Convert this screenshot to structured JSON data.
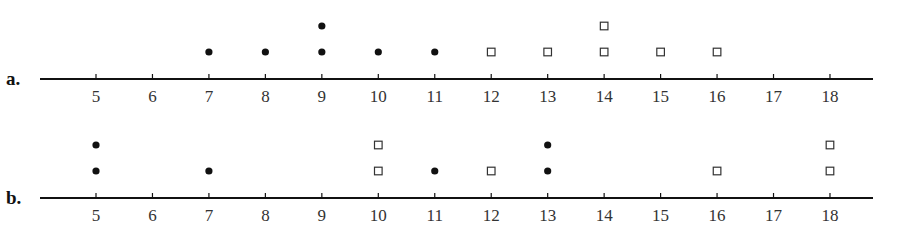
{
  "chart_data": [
    {
      "type": "scatter",
      "subtype": "dot_plot",
      "panel_label": "a.",
      "title": "",
      "xlabel": "",
      "ylabel": "",
      "xlim": [
        4,
        19
      ],
      "ticks": [
        5,
        6,
        7,
        8,
        9,
        10,
        11,
        12,
        13,
        14,
        15,
        16,
        17,
        18
      ],
      "tick_labels": [
        "5",
        "6",
        "7",
        "8",
        "9",
        "10",
        "11",
        "12",
        "13",
        "14",
        "15",
        "16",
        "17",
        "18"
      ],
      "grid": false,
      "legend": null,
      "series": [
        {
          "name": "filled-circle",
          "marker": "circle-filled",
          "values": [
            7,
            8,
            9,
            9,
            10,
            11
          ],
          "counts": {
            "7": 1,
            "8": 1,
            "9": 2,
            "10": 1,
            "11": 1
          }
        },
        {
          "name": "open-square",
          "marker": "square-open",
          "values": [
            12,
            13,
            14,
            14,
            15,
            16
          ],
          "counts": {
            "12": 1,
            "13": 1,
            "14": 2,
            "15": 1,
            "16": 1
          }
        }
      ]
    },
    {
      "type": "scatter",
      "subtype": "dot_plot",
      "panel_label": "b.",
      "title": "",
      "xlabel": "",
      "ylabel": "",
      "xlim": [
        4,
        19
      ],
      "ticks": [
        5,
        6,
        7,
        8,
        9,
        10,
        11,
        12,
        13,
        14,
        15,
        16,
        17,
        18
      ],
      "tick_labels": [
        "5",
        "6",
        "7",
        "8",
        "9",
        "10",
        "11",
        "12",
        "13",
        "14",
        "15",
        "16",
        "17",
        "18"
      ],
      "grid": false,
      "legend": null,
      "series": [
        {
          "name": "filled-circle",
          "marker": "circle-filled",
          "values": [
            5,
            5,
            7,
            11,
            13,
            13
          ],
          "counts": {
            "5": 2,
            "7": 1,
            "11": 1,
            "13": 2
          }
        },
        {
          "name": "open-square",
          "marker": "square-open",
          "values": [
            10,
            10,
            12,
            16,
            18,
            18
          ],
          "counts": {
            "10": 2,
            "12": 1,
            "16": 1,
            "18": 2
          }
        }
      ]
    }
  ],
  "colors": {
    "axis": "#111111",
    "marker": "#111111",
    "tick_label": "#333333"
  }
}
